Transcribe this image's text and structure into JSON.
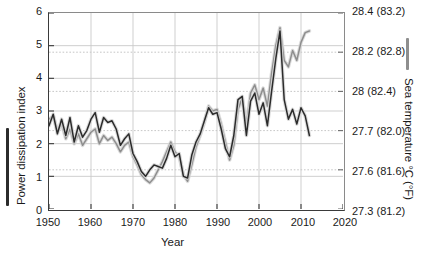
{
  "chart_data": {
    "type": "line",
    "title": "",
    "xlabel": "Year",
    "ylabel": "Power dissipation index",
    "y2label": "Sea temperature °C (°F)",
    "xlim": [
      1950,
      2020
    ],
    "ylim": [
      0,
      6
    ],
    "grid": true,
    "legend_position": "axis-labels",
    "xticks": [
      "1950",
      "1960",
      "1970",
      "1980",
      "1990",
      "2000",
      "2010",
      "2020"
    ],
    "xtick_values": [
      1950,
      1960,
      1970,
      1980,
      1990,
      2000,
      2010,
      2020
    ],
    "yticks": [
      "0",
      "1",
      "2",
      "3",
      "4",
      "5",
      "6"
    ],
    "ytick_values": [
      0,
      1,
      2,
      3,
      4,
      5,
      6
    ],
    "y2ticks": [
      "27.3 (81.2)",
      "27.6 (81.6)",
      "27.7 (82.0)",
      "28 (82.4)",
      "28.2 (82.8)",
      "28.4 (83.2)"
    ],
    "y2tick_positions": [
      0.0,
      1.2,
      2.4,
      3.6,
      4.8,
      6.0
    ],
    "series": [
      {
        "name": "Power dissipation index",
        "color": "#2b2b2b",
        "x": [
          1950,
          1951,
          1952,
          1953,
          1954,
          1955,
          1956,
          1957,
          1958,
          1959,
          1960,
          1961,
          1962,
          1963,
          1964,
          1965,
          1966,
          1967,
          1968,
          1969,
          1970,
          1971,
          1972,
          1973,
          1974,
          1975,
          1976,
          1977,
          1978,
          1979,
          1980,
          1981,
          1982,
          1983,
          1984,
          1985,
          1986,
          1987,
          1988,
          1989,
          1990,
          1991,
          1992,
          1993,
          1994,
          1995,
          1996,
          1997,
          1998,
          1999,
          2000,
          2001,
          2002,
          2003,
          2004,
          2005,
          2006,
          2007,
          2008,
          2009,
          2010,
          2011,
          2012
        ],
        "values": [
          2.55,
          2.9,
          2.3,
          2.75,
          2.25,
          2.8,
          2.05,
          2.55,
          2.2,
          2.4,
          2.75,
          2.95,
          2.35,
          2.8,
          2.65,
          2.7,
          2.45,
          1.95,
          2.15,
          2.3,
          1.7,
          1.45,
          1.15,
          1.0,
          1.2,
          1.35,
          1.3,
          1.25,
          1.55,
          1.95,
          1.6,
          1.7,
          1.0,
          0.95,
          1.65,
          2.05,
          2.3,
          2.7,
          3.1,
          2.9,
          2.95,
          2.45,
          1.85,
          1.6,
          2.25,
          3.35,
          3.45,
          2.25,
          3.3,
          3.55,
          2.9,
          3.25,
          2.55,
          3.6,
          4.6,
          5.45,
          3.35,
          2.75,
          3.05,
          2.6,
          3.1,
          2.85,
          2.25
        ]
      },
      {
        "name": "Sea temperature",
        "color": "#8e8e8e",
        "x": [
          1950,
          1951,
          1952,
          1953,
          1954,
          1955,
          1956,
          1957,
          1958,
          1959,
          1960,
          1961,
          1962,
          1963,
          1964,
          1965,
          1966,
          1967,
          1968,
          1969,
          1970,
          1971,
          1972,
          1973,
          1974,
          1975,
          1976,
          1977,
          1978,
          1979,
          1980,
          1981,
          1982,
          1983,
          1984,
          1985,
          1986,
          1987,
          1988,
          1989,
          1990,
          1991,
          1992,
          1993,
          1994,
          1995,
          1996,
          1997,
          1998,
          1999,
          2000,
          2001,
          2002,
          2003,
          2004,
          2005,
          2006,
          2007,
          2008,
          2009,
          2010,
          2011,
          2012
        ],
        "values": [
          2.75,
          2.85,
          2.4,
          2.6,
          2.15,
          2.45,
          2.0,
          2.3,
          1.95,
          2.15,
          2.35,
          2.45,
          2.0,
          2.25,
          2.1,
          2.2,
          2.0,
          1.75,
          1.95,
          2.05,
          1.6,
          1.35,
          1.05,
          0.9,
          0.8,
          0.95,
          1.2,
          1.45,
          1.75,
          2.05,
          1.75,
          1.6,
          1.05,
          0.85,
          1.35,
          1.9,
          2.25,
          2.65,
          3.15,
          3.0,
          3.05,
          2.6,
          2.05,
          1.5,
          1.95,
          3.05,
          3.4,
          2.6,
          3.55,
          3.8,
          3.35,
          3.7,
          3.15,
          4.15,
          5.0,
          5.55,
          4.55,
          4.35,
          4.85,
          4.55,
          5.1,
          5.4,
          5.45
        ]
      }
    ]
  }
}
